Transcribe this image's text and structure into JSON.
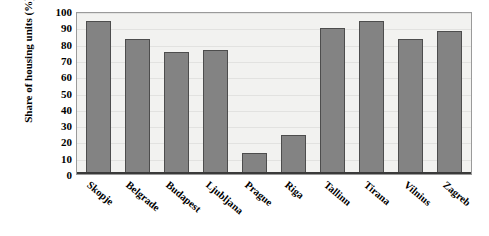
{
  "chart_data": {
    "type": "bar",
    "title": "",
    "subtitle": "",
    "xlabel": "",
    "ylabel": "Share of housing units (%)",
    "categories": [
      "Skopje",
      "Belgrade",
      "Budapest",
      "Ljubljana",
      "Prague",
      "Riga",
      "Tallinn",
      "Tirana",
      "Vilnius",
      "Zagreb"
    ],
    "values": [
      95,
      84,
      76,
      77,
      13,
      24,
      91,
      95,
      84,
      89
    ],
    "ylim": [
      0,
      100
    ],
    "y_ticks": [
      0,
      10,
      20,
      30,
      40,
      50,
      60,
      70,
      80,
      90,
      100
    ],
    "y_tick_labels": [
      "0",
      "10",
      "20",
      "30",
      "40",
      "50",
      "60",
      "70",
      "80",
      "90",
      "100"
    ],
    "grid": true,
    "legend": false,
    "legend_position": "none",
    "bar_color": "#838383",
    "bar_border_color": "#4d4d4d",
    "plot_background": "#f2f2f0",
    "axis_color": "#3a3a3a",
    "gridline_color": "#e2e2e0",
    "x_label_rotation": 40
  }
}
